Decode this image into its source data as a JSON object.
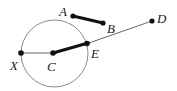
{
  "figure": {
    "width": 177,
    "height": 91,
    "background_color": "#ffffff",
    "stroke_color": "#111111",
    "thin_stroke_color": "#555555",
    "circle_stroke_color": "#888888"
  },
  "labels": {
    "a": "A",
    "b": "B",
    "c": "C",
    "d": "D",
    "e": "E",
    "x": "X"
  },
  "geometry": {
    "circle": {
      "cx": 54.5,
      "cy": 53.5,
      "r": 33.5
    },
    "points": {
      "A": {
        "x": 73,
        "y": 16
      },
      "B": {
        "x": 103,
        "y": 23
      },
      "C": {
        "x": 53,
        "y": 53
      },
      "D": {
        "x": 152,
        "y": 21
      },
      "E": {
        "x": 86,
        "y": 44
      },
      "X": {
        "x": 21,
        "y": 53
      }
    },
    "segments": [
      {
        "name": "AB",
        "from": "A",
        "to": "B",
        "weight": "thick"
      },
      {
        "name": "CE",
        "from": "C",
        "to": "E",
        "weight": "thick"
      },
      {
        "name": "XC",
        "from": "X",
        "to": "C",
        "weight": "thin"
      },
      {
        "name": "ED",
        "from": "E",
        "to": "D",
        "weight": "thin"
      }
    ]
  },
  "label_positions": {
    "A": {
      "left": 59,
      "top": 5
    },
    "B": {
      "left": 107,
      "top": 22
    },
    "C": {
      "left": 47,
      "top": 60
    },
    "D": {
      "left": 157,
      "top": 12
    },
    "E": {
      "left": 91,
      "top": 47
    },
    "X": {
      "left": 10,
      "top": 59
    }
  }
}
